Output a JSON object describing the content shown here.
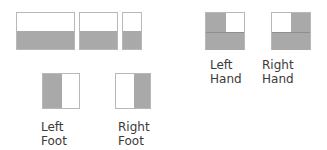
{
  "colors": {
    "fill": "#a9a9a9",
    "empty": "#ffffff",
    "border": "#b8b8b8",
    "text": "#3a3a3a"
  },
  "top_boxes": [
    {
      "name": "wide-box",
      "split": "horizontal",
      "filled": "bottom"
    },
    {
      "name": "medium-box",
      "split": "horizontal",
      "filled": "bottom"
    },
    {
      "name": "narrow-box",
      "split": "horizontal",
      "filled": "bottom"
    }
  ],
  "hands": {
    "left": {
      "line1": "Left",
      "line2": "Hand",
      "filled": [
        "top-left",
        "bottom"
      ]
    },
    "right": {
      "line1": "Right",
      "line2": "Hand",
      "filled": [
        "top-right",
        "bottom"
      ]
    }
  },
  "feet": {
    "left": {
      "line1": "Left",
      "line2": "Foot",
      "filled": "left"
    },
    "right": {
      "line1": "Right",
      "line2": "Foot",
      "filled": "right"
    }
  }
}
